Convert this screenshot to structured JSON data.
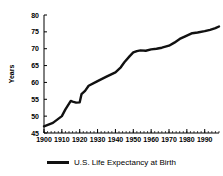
{
  "chart_data": {
    "type": "line",
    "title": "",
    "subtitle": "",
    "xlabel": "",
    "ylabel": "Years",
    "xlim": [
      1900,
      1998
    ],
    "ylim": [
      45,
      80
    ],
    "grid": false,
    "legend_position": "bottom-center",
    "x_tick_labels": [
      "1900",
      "1910",
      "1920",
      "1930",
      "1940",
      "1950",
      "1960",
      "1970",
      "1980",
      "1990"
    ],
    "x_ticks": [
      1900,
      1910,
      1920,
      1930,
      1940,
      1950,
      1960,
      1970,
      1980,
      1990
    ],
    "x_minor_tick_step": 2,
    "y_tick_labels": [
      "45",
      "50",
      "55",
      "60",
      "65",
      "70",
      "75",
      "80"
    ],
    "y_ticks": [
      45,
      50,
      55,
      60,
      65,
      70,
      75,
      80
    ],
    "legend": [
      "U.S. Life Expectancy at Birth"
    ],
    "series": [
      {
        "name": "U.S. Life Expectancy at Birth",
        "color": "#111111",
        "x": [
          1900,
          1905,
          1910,
          1912,
          1915,
          1916,
          1918,
          1920,
          1921,
          1923,
          1925,
          1930,
          1935,
          1940,
          1943,
          1945,
          1948,
          1950,
          1952,
          1954,
          1957,
          1960,
          1963,
          1966,
          1970,
          1973,
          1976,
          1980,
          1983,
          1986,
          1990,
          1993,
          1996,
          1998
        ],
        "values": [
          47.0,
          48.0,
          50.0,
          52.0,
          54.5,
          54.3,
          54.0,
          54.1,
          56.5,
          57.5,
          59.0,
          60.4,
          61.7,
          63.0,
          64.5,
          66.0,
          67.8,
          68.9,
          69.3,
          69.5,
          69.4,
          69.8,
          70.0,
          70.3,
          70.9,
          71.8,
          72.9,
          73.9,
          74.6,
          74.8,
          75.2,
          75.6,
          76.1,
          76.6
        ]
      }
    ]
  },
  "legend": {
    "entry_label": "U.S. Life Expectancy at Birth"
  },
  "axes": {
    "y_title": "Years"
  }
}
